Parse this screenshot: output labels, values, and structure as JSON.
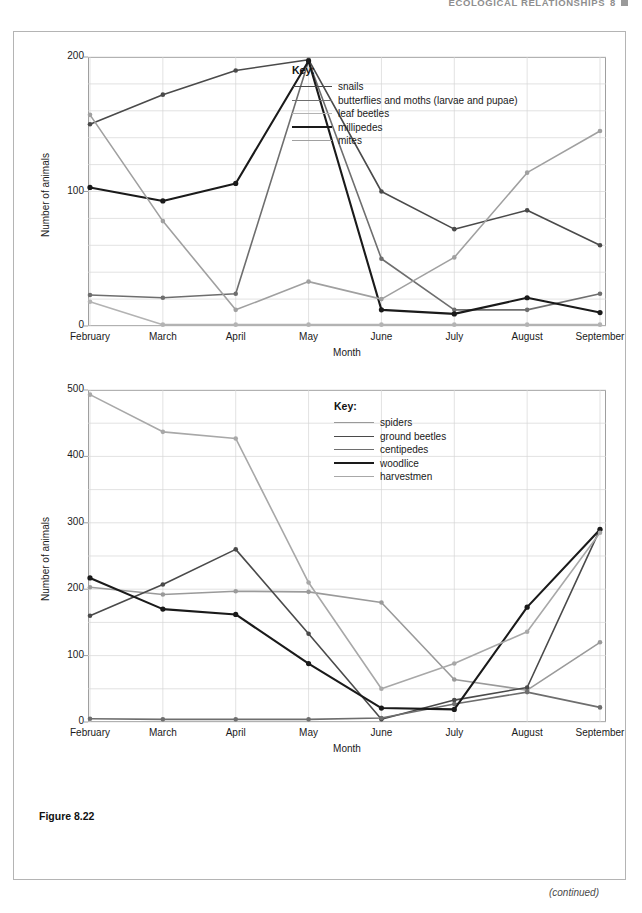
{
  "running_head": {
    "text": "ECOLOGICAL RELATIONSHIPS",
    "chapter": "8",
    "marker_icon": "square-marker-icon"
  },
  "figure": {
    "caption": "Figure 8.22",
    "continued_note": "(continued)"
  },
  "colors": {
    "snails": "#4a4a4a",
    "butterflies": "#6e6e6e",
    "leaf_beetles": "#b3b3b3",
    "millipedes": "#1a1a1a",
    "mites": "#a0a0a0",
    "spiders": "#9a9a9a",
    "ground_beetles": "#4a4a4a",
    "centipedes": "#6e6e6e",
    "woodlice": "#1a1a1a",
    "harvestmen": "#a8a8a8",
    "grid": "#d6d6d6",
    "axis": "#9f9f9f",
    "frame": "#b4b4b4"
  },
  "chart_data": [
    {
      "type": "line",
      "title": "",
      "xlabel": "Month",
      "ylabel": "Number of animals",
      "categories": [
        "February",
        "March",
        "April",
        "May",
        "June",
        "July",
        "August",
        "September"
      ],
      "ylim": [
        0,
        200
      ],
      "yticks": [
        0,
        100,
        200
      ],
      "ytick_labels": [
        "0",
        "100",
        "200"
      ],
      "grid": true,
      "legend_title": "Key:",
      "legend_position": "inside-top-right",
      "series": [
        {
          "name": "snails",
          "values": [
            150,
            172,
            190,
            198,
            100,
            72,
            86,
            60
          ],
          "color_key": "snails",
          "width": 1.6
        },
        {
          "name": "butterflies and moths (larvae and pupae)",
          "values": [
            23,
            21,
            24,
            197,
            50,
            12,
            12,
            24
          ],
          "color_key": "butterflies",
          "width": 1.6
        },
        {
          "name": "leaf beetles",
          "values": [
            18,
            1,
            1,
            1,
            1,
            1,
            1,
            1
          ],
          "color_key": "leaf_beetles",
          "width": 1.6
        },
        {
          "name": "millipedes",
          "values": [
            103,
            93,
            106,
            197,
            12,
            9,
            21,
            10
          ],
          "color_key": "millipedes",
          "width": 2.1
        },
        {
          "name": "mites",
          "values": [
            157,
            78,
            12,
            33,
            20,
            51,
            114,
            145
          ],
          "color_key": "mites",
          "width": 1.6
        }
      ]
    },
    {
      "type": "line",
      "title": "",
      "xlabel": "Month",
      "ylabel": "Number of animals",
      "categories": [
        "February",
        "March",
        "April",
        "May",
        "June",
        "July",
        "August",
        "September"
      ],
      "ylim": [
        0,
        500
      ],
      "yticks": [
        0,
        100,
        200,
        300,
        400,
        500
      ],
      "ytick_labels": [
        "0",
        "100",
        "200",
        "300",
        "400",
        "500"
      ],
      "grid": true,
      "legend_title": "Key:",
      "legend_position": "inside-top-right",
      "series": [
        {
          "name": "spiders",
          "values": [
            203,
            192,
            197,
            196,
            180,
            64,
            48,
            120
          ],
          "color_key": "spiders",
          "width": 1.6
        },
        {
          "name": "ground beetles",
          "values": [
            160,
            207,
            260,
            133,
            4,
            33,
            52,
            290
          ],
          "color_key": "ground_beetles",
          "width": 1.6
        },
        {
          "name": "centipedes",
          "values": [
            5,
            4,
            4,
            4,
            6,
            27,
            45,
            22
          ],
          "color_key": "centipedes",
          "width": 1.6
        },
        {
          "name": "woodlice",
          "values": [
            217,
            170,
            162,
            88,
            21,
            19,
            173,
            290
          ],
          "color_key": "woodlice",
          "width": 2.1
        },
        {
          "name": "harvestmen",
          "values": [
            493,
            437,
            427,
            210,
            50,
            88,
            136,
            285
          ],
          "color_key": "harvestmen",
          "width": 1.6
        }
      ]
    }
  ]
}
